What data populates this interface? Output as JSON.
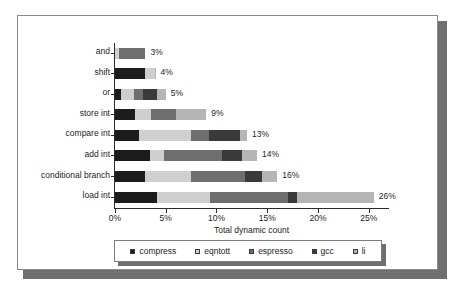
{
  "chart_data": {
    "type": "bar",
    "orientation": "horizontal",
    "stacked": true,
    "title": "",
    "xlabel": "Total dynamic count",
    "ylabel": "",
    "xlim": [
      0,
      27
    ],
    "xticks": [
      "0%",
      "5%",
      "10%",
      "15%",
      "20%",
      "25%"
    ],
    "xtick_values": [
      0,
      5,
      10,
      15,
      20,
      25
    ],
    "grid": false,
    "legend_position": "bottom",
    "categories": [
      "and",
      "shift",
      "or",
      "store int",
      "compare int",
      "add int",
      "conditional branch",
      "load int"
    ],
    "totals": [
      3,
      4,
      5,
      9,
      13,
      14,
      16,
      26
    ],
    "total_labels": [
      "3%",
      "4%",
      "5%",
      "9%",
      "13%",
      "14%",
      "16%",
      "26%"
    ],
    "series": [
      {
        "name": "compress",
        "color": "#1c1c1c",
        "values": [
          0.0,
          3.0,
          0.6,
          2.0,
          2.4,
          3.4,
          3.0,
          4.1
        ]
      },
      {
        "name": "eqntott",
        "color": "#cfcfcf",
        "values": [
          0.4,
          0.9,
          1.3,
          1.5,
          5.1,
          1.4,
          4.5,
          5.3
        ]
      },
      {
        "name": "espresso",
        "color": "#6e6e6e",
        "values": [
          2.6,
          0.0,
          0.9,
          2.5,
          1.8,
          5.7,
          5.3,
          7.6
        ]
      },
      {
        "name": "gcc",
        "color": "#3a3a3a",
        "values": [
          0.0,
          0.0,
          1.3,
          0.0,
          3.0,
          2.0,
          1.7,
          0.9
        ]
      },
      {
        "name": "li",
        "color": "#b5b5b5",
        "values": [
          0.0,
          0.1,
          0.9,
          3.0,
          0.7,
          1.5,
          1.5,
          7.6
        ]
      }
    ]
  },
  "legend": {
    "items": [
      {
        "label": "compress"
      },
      {
        "label": "eqntott"
      },
      {
        "label": "espresso"
      },
      {
        "label": "gcc"
      },
      {
        "label": "li"
      }
    ]
  }
}
